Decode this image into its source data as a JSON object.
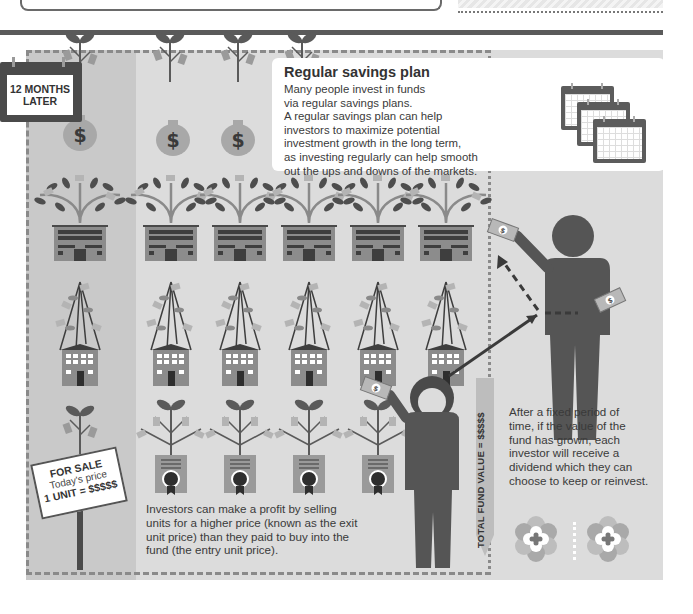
{
  "header": {
    "calendar_tag": "12 MONTHS LATER"
  },
  "info_box": {
    "title": "Regular savings plan",
    "lines": [
      "Many people invest in funds",
      "via regular savings plans.",
      "A regular savings plan can help",
      "investors to maximize potential",
      "investment growth in the long term,",
      "as investing regularly can help smooth",
      "out the ups and downs of the markets."
    ],
    "icon": "calendar-stack-icon"
  },
  "for_sale_sign": {
    "line1": "FOR SALE",
    "line2": "Today's price",
    "line3": "1 UNIT = $$$$$"
  },
  "profit_text": {
    "lines": [
      "Investors can make a profit by selling",
      "units for a higher price (known as the exit",
      "unit price) than they paid to buy into the",
      "fund (the entry unit price)."
    ]
  },
  "fund_value": {
    "label": "TOTAL FUND VALUE = $$$$$"
  },
  "dividend_text": {
    "lines": [
      "After a fixed period of",
      "time, if the value of the",
      "fund has grown, each",
      "investor will receive a",
      "dividend which they can",
      "choose to keep or reinvest."
    ]
  },
  "illustration": {
    "money_bags": 4,
    "columns": 6,
    "rows": [
      "tree-on-office-building",
      "tree-on-house",
      "tree-on-certificate"
    ],
    "bag_symbol": "$",
    "colors": {
      "panel": "#dcdcdc",
      "panel_left": "#c9c9c9",
      "figure": "#555555",
      "dark": "#4a4a4a"
    }
  }
}
